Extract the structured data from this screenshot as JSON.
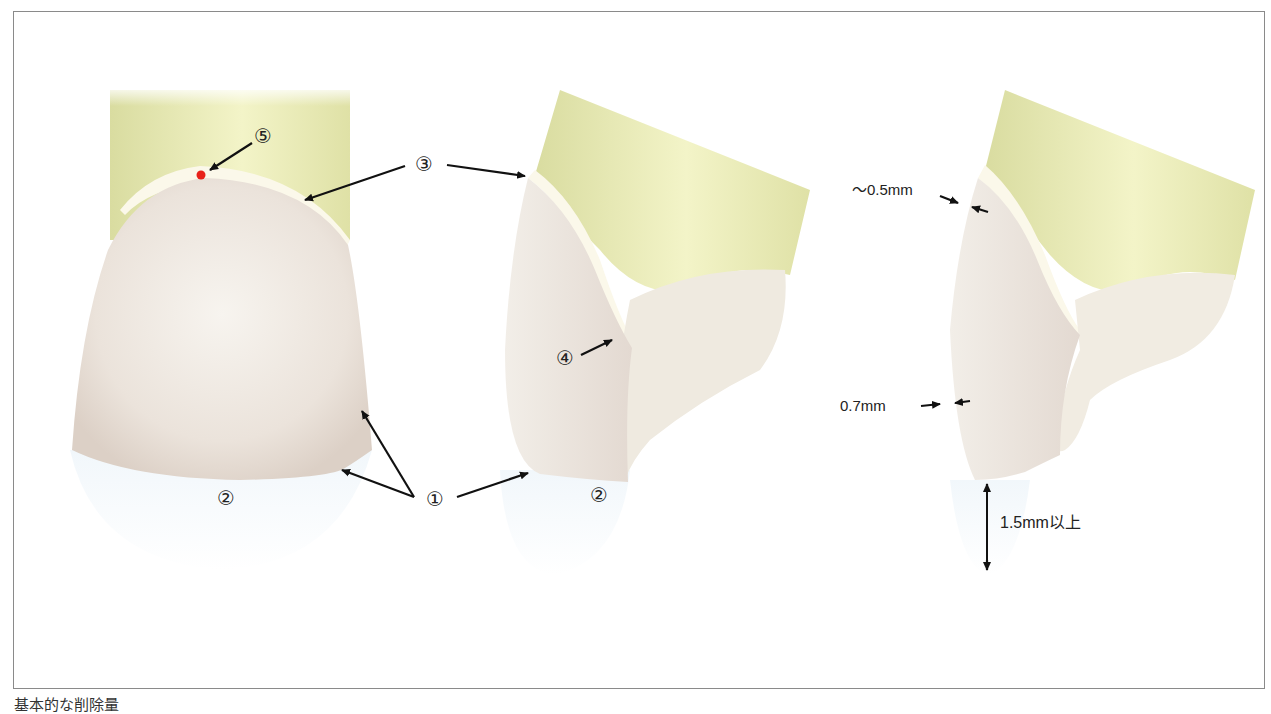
{
  "figure": {
    "caption": "基本的な削除量",
    "views": [
      {
        "name": "labial-view",
        "labels": {
          "n1": "①",
          "n2": "②",
          "n3": "③",
          "n5": "⑤"
        }
      },
      {
        "name": "proximal-view",
        "labels": {
          "n2": "②",
          "n4": "④"
        }
      },
      {
        "name": "section-view",
        "labels": {
          "cervical": "～0.5mm",
          "body": "0.7mm",
          "incisal": "1.5mm以上"
        }
      }
    ]
  },
  "colors": {
    "tooth": "#ece4dc",
    "root": "#e8eab6",
    "chamfer": "#fbf8ea",
    "marker_red": "#e8221a",
    "arrow": "#111111",
    "border": "#8a8a8a"
  }
}
